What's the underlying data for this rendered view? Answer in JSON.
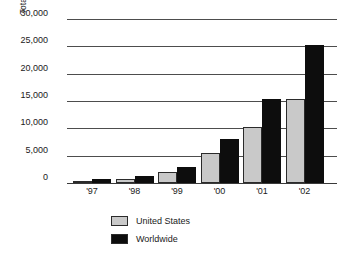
{
  "chart_data": {
    "type": "bar",
    "title": "",
    "xlabel": "",
    "ylabel": "Total Implementations",
    "categories": [
      "'97",
      "'98",
      "'99",
      "'00",
      "'01",
      "'02"
    ],
    "series": [
      {
        "name": "United States",
        "color": "#c9c9c9",
        "values": [
          300,
          800,
          2000,
          5500,
          10200,
          15300
        ]
      },
      {
        "name": "Worldwide",
        "color": "#0d0d0d",
        "values": [
          700,
          1200,
          3000,
          8000,
          15300,
          25300
        ]
      }
    ],
    "ylim": [
      0,
      30000
    ],
    "ytick_labels": [
      "30,000",
      "25,000",
      "20,000",
      "15,000",
      "10,000",
      "5,000",
      "0"
    ],
    "ytick_values": [
      30000,
      25000,
      20000,
      15000,
      10000,
      5000,
      0
    ],
    "grid": true,
    "legend_position": "bottom-left"
  },
  "legend": {
    "items": [
      {
        "label": "United States",
        "swatch": "#c9c9c9"
      },
      {
        "label": "Worldwide",
        "swatch": "#0d0d0d"
      }
    ]
  }
}
